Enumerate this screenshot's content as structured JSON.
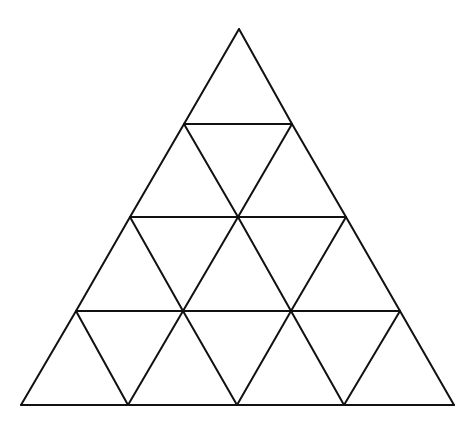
{
  "diagram": {
    "title": "",
    "rows": 4,
    "small_triangle_count": 16,
    "stroke_color": "#111111",
    "background_color": "#ffffff",
    "vertex_rows": [
      [
        [
          239,
          29
        ]
      ],
      [
        [
          184,
          124
        ],
        [
          292,
          124
        ]
      ],
      [
        [
          130,
          217
        ],
        [
          238,
          217
        ],
        [
          346,
          217
        ]
      ],
      [
        [
          76,
          311
        ],
        [
          183,
          311
        ],
        [
          291,
          311
        ],
        [
          400,
          311
        ]
      ],
      [
        [
          21,
          405
        ],
        [
          128,
          405
        ],
        [
          237,
          405
        ],
        [
          344,
          405
        ],
        [
          454,
          405
        ]
      ]
    ]
  }
}
